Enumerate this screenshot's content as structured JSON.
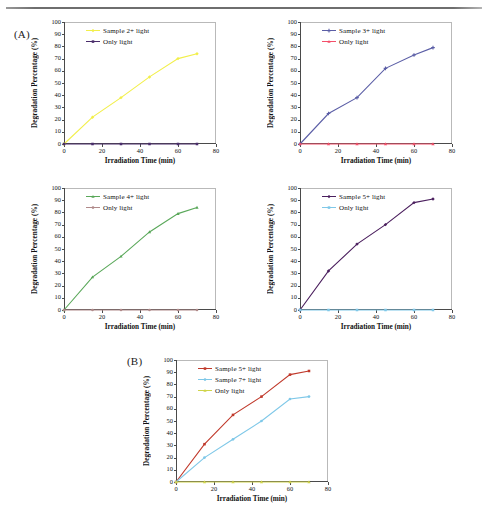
{
  "figure": {
    "panel_a_label": "(A)",
    "panel_b_label": "(B)",
    "axis_x_title": "Irradiation Time (min)",
    "axis_y_title": "Degradation Percentage (%)",
    "x_ticks": [
      "0",
      "20",
      "40",
      "60",
      "80"
    ],
    "y_ticks": [
      "0",
      "10",
      "20",
      "30",
      "40",
      "50",
      "60",
      "70",
      "80",
      "90",
      "100"
    ]
  },
  "colors": {
    "yellow": "#f2ef4a",
    "dark_purple_line": "#4a2d6b",
    "indigo": "#5b5ea6",
    "red": "#f4506a",
    "green": "#5aa85a",
    "mauve": "#b08a8a",
    "deep_purple": "#4b1f5e",
    "light_blue": "#7fc8e8",
    "brick_red": "#c0392b",
    "yellow_green": "#cfd44a",
    "axis": "#4a4a4a",
    "frame": "#b9b9b9"
  },
  "chart_data": [
    {
      "id": "chart-a1",
      "type": "line",
      "title": "",
      "xlabel": "Irradiation Time (min)",
      "ylabel": "Degradation Percentage (%)",
      "xlim": [
        0,
        80
      ],
      "ylim": [
        0,
        100
      ],
      "grid": false,
      "legend_position": "top-left-inside",
      "x": [
        0,
        15,
        30,
        45,
        60,
        70
      ],
      "series": [
        {
          "name": "Sample 2+ light",
          "color": "#f2ef4a",
          "marker": "diamond",
          "values": [
            0,
            22,
            38,
            55,
            70,
            74
          ]
        },
        {
          "name": "Only light",
          "color": "#4a2d6b",
          "marker": "square",
          "values": [
            0,
            0,
            0,
            0,
            0,
            0
          ]
        }
      ]
    },
    {
      "id": "chart-a2",
      "type": "line",
      "title": "",
      "xlabel": "Irradiation Time (min)",
      "ylabel": "Degradation Percentage (%)",
      "xlim": [
        0,
        80
      ],
      "ylim": [
        0,
        100
      ],
      "grid": false,
      "legend_position": "top-left-inside",
      "x": [
        0,
        15,
        30,
        45,
        60,
        70
      ],
      "series": [
        {
          "name": "Sample 3+ light",
          "color": "#5b5ea6",
          "marker": "plus",
          "values": [
            0,
            25,
            38,
            62,
            73,
            79
          ]
        },
        {
          "name": "Only light",
          "color": "#f4506a",
          "marker": "triangle",
          "values": [
            0,
            0,
            0,
            0,
            0,
            0
          ]
        }
      ]
    },
    {
      "id": "chart-a3",
      "type": "line",
      "title": "",
      "xlabel": "Irradiation Time (min)",
      "ylabel": "Degradation Percentage (%)",
      "xlim": [
        0,
        80
      ],
      "ylim": [
        0,
        100
      ],
      "grid": false,
      "legend_position": "top-left-inside",
      "x": [
        0,
        15,
        30,
        45,
        60,
        70
      ],
      "series": [
        {
          "name": "Sample 4+ light",
          "color": "#5aa85a",
          "marker": "triangle",
          "values": [
            0,
            27,
            44,
            64,
            79,
            84
          ]
        },
        {
          "name": "Only light",
          "color": "#b08a8a",
          "marker": "circle",
          "values": [
            0,
            0,
            0,
            0,
            0,
            0
          ]
        }
      ]
    },
    {
      "id": "chart-a4",
      "type": "line",
      "title": "",
      "xlabel": "Irradiation Time (min)",
      "ylabel": "Degradation Percentage (%)",
      "xlim": [
        0,
        80
      ],
      "ylim": [
        0,
        100
      ],
      "grid": false,
      "legend_position": "top-left-inside",
      "x": [
        0,
        15,
        30,
        45,
        60,
        70
      ],
      "series": [
        {
          "name": "Sample 5+ light",
          "color": "#4b1f5e",
          "marker": "diamond",
          "values": [
            0,
            32,
            54,
            70,
            88,
            91
          ]
        },
        {
          "name": "Only light",
          "color": "#7fc8e8",
          "marker": "square",
          "values": [
            0,
            0,
            0,
            0,
            0,
            0
          ]
        }
      ]
    },
    {
      "id": "chart-b",
      "type": "line",
      "title": "",
      "xlabel": "Irradiation Time (min)",
      "ylabel": "Degradation Percentage (%)",
      "xlim": [
        0,
        80
      ],
      "ylim": [
        0,
        100
      ],
      "grid": false,
      "legend_position": "top-left-inside",
      "x": [
        0,
        15,
        30,
        45,
        60,
        70
      ],
      "series": [
        {
          "name": "Sample 5+ light",
          "color": "#c0392b",
          "marker": "square",
          "values": [
            0,
            31,
            55,
            70,
            88,
            91
          ]
        },
        {
          "name": "Sample 7+ light",
          "color": "#7fc8e8",
          "marker": "circle",
          "values": [
            0,
            20,
            35,
            50,
            68,
            70
          ]
        },
        {
          "name": "Only light",
          "color": "#cfd44a",
          "marker": "triangle",
          "values": [
            0,
            0,
            0,
            0,
            0,
            0
          ]
        }
      ]
    }
  ]
}
